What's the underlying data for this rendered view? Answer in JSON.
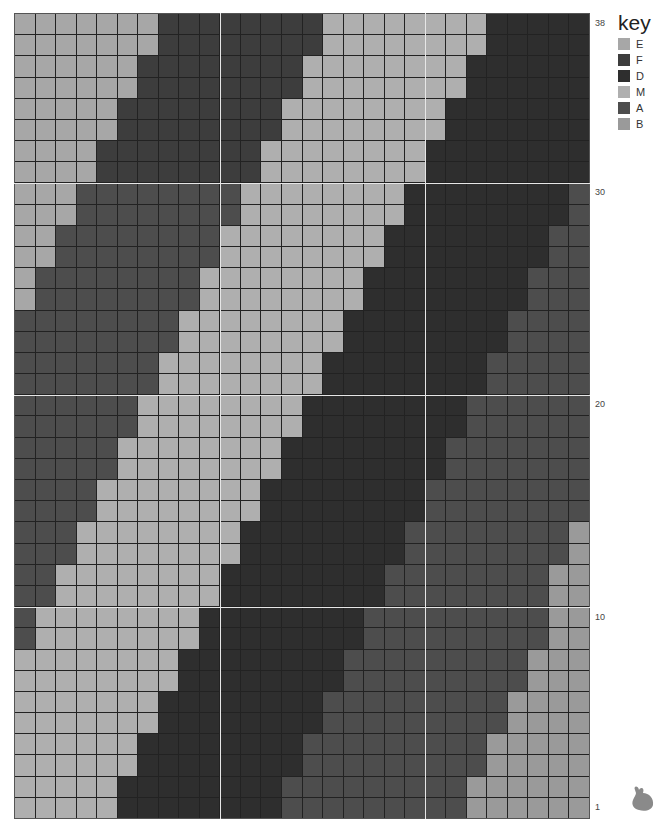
{
  "chart_data": {
    "type": "heatmap",
    "title": "",
    "columns": 28,
    "rows": 38,
    "row_labels": [
      {
        "label": "38",
        "row": 38
      },
      {
        "label": "30",
        "row": 30
      },
      {
        "label": "20",
        "row": 20
      },
      {
        "label": "10",
        "row": 10
      },
      {
        "label": "1",
        "row": 1
      }
    ],
    "legend_title": "key",
    "legend": [
      {
        "code": "E",
        "color": "#a7a7a7"
      },
      {
        "code": "F",
        "color": "#3d3d3d"
      },
      {
        "code": "D",
        "color": "#2e2e2e"
      },
      {
        "code": "M",
        "color": "#afafaf"
      },
      {
        "code": "A",
        "color": "#4d4d4d"
      },
      {
        "code": "B",
        "color": "#9a9a9a"
      }
    ],
    "grid_rows_top_to_bottom": [
      {
        "row": 38,
        "runs": [
          [
            "E",
            7
          ],
          [
            "F",
            8
          ],
          [
            "M",
            8
          ],
          [
            "D",
            5
          ]
        ]
      },
      {
        "row": 37,
        "runs": [
          [
            "E",
            7
          ],
          [
            "F",
            8
          ],
          [
            "M",
            8
          ],
          [
            "D",
            5
          ]
        ]
      },
      {
        "row": 36,
        "runs": [
          [
            "E",
            6
          ],
          [
            "F",
            8
          ],
          [
            "M",
            8
          ],
          [
            "D",
            6
          ]
        ]
      },
      {
        "row": 35,
        "runs": [
          [
            "E",
            6
          ],
          [
            "F",
            8
          ],
          [
            "M",
            8
          ],
          [
            "D",
            6
          ]
        ]
      },
      {
        "row": 34,
        "runs": [
          [
            "E",
            5
          ],
          [
            "F",
            8
          ],
          [
            "M",
            8
          ],
          [
            "D",
            7
          ]
        ]
      },
      {
        "row": 33,
        "runs": [
          [
            "E",
            5
          ],
          [
            "F",
            8
          ],
          [
            "M",
            8
          ],
          [
            "D",
            7
          ]
        ]
      },
      {
        "row": 32,
        "runs": [
          [
            "E",
            4
          ],
          [
            "F",
            8
          ],
          [
            "M",
            8
          ],
          [
            "D",
            8
          ]
        ]
      },
      {
        "row": 31,
        "runs": [
          [
            "E",
            4
          ],
          [
            "F",
            8
          ],
          [
            "M",
            8
          ],
          [
            "D",
            8
          ]
        ]
      },
      {
        "row": 30,
        "runs": [
          [
            "E",
            3
          ],
          [
            "A",
            8
          ],
          [
            "M",
            8
          ],
          [
            "D",
            8
          ],
          [
            "A",
            1
          ]
        ]
      },
      {
        "row": 29,
        "runs": [
          [
            "E",
            3
          ],
          [
            "A",
            8
          ],
          [
            "M",
            8
          ],
          [
            "D",
            8
          ],
          [
            "A",
            1
          ]
        ]
      },
      {
        "row": 28,
        "runs": [
          [
            "E",
            2
          ],
          [
            "A",
            8
          ],
          [
            "M",
            8
          ],
          [
            "D",
            8
          ],
          [
            "A",
            2
          ]
        ]
      },
      {
        "row": 27,
        "runs": [
          [
            "E",
            2
          ],
          [
            "A",
            8
          ],
          [
            "M",
            8
          ],
          [
            "D",
            8
          ],
          [
            "A",
            2
          ]
        ]
      },
      {
        "row": 26,
        "runs": [
          [
            "E",
            1
          ],
          [
            "A",
            8
          ],
          [
            "M",
            8
          ],
          [
            "D",
            8
          ],
          [
            "A",
            3
          ]
        ]
      },
      {
        "row": 25,
        "runs": [
          [
            "E",
            1
          ],
          [
            "A",
            8
          ],
          [
            "M",
            8
          ],
          [
            "D",
            8
          ],
          [
            "A",
            3
          ]
        ]
      },
      {
        "row": 24,
        "runs": [
          [
            "A",
            8
          ],
          [
            "M",
            8
          ],
          [
            "D",
            8
          ],
          [
            "A",
            4
          ]
        ]
      },
      {
        "row": 23,
        "runs": [
          [
            "A",
            8
          ],
          [
            "M",
            8
          ],
          [
            "D",
            8
          ],
          [
            "A",
            4
          ]
        ]
      },
      {
        "row": 22,
        "runs": [
          [
            "A",
            7
          ],
          [
            "M",
            8
          ],
          [
            "D",
            8
          ],
          [
            "A",
            5
          ]
        ]
      },
      {
        "row": 21,
        "runs": [
          [
            "A",
            7
          ],
          [
            "M",
            8
          ],
          [
            "D",
            8
          ],
          [
            "A",
            5
          ]
        ]
      },
      {
        "row": 20,
        "runs": [
          [
            "A",
            6
          ],
          [
            "M",
            8
          ],
          [
            "D",
            8
          ],
          [
            "A",
            6
          ]
        ]
      },
      {
        "row": 19,
        "runs": [
          [
            "A",
            6
          ],
          [
            "M",
            8
          ],
          [
            "D",
            8
          ],
          [
            "A",
            6
          ]
        ]
      },
      {
        "row": 18,
        "runs": [
          [
            "A",
            5
          ],
          [
            "M",
            8
          ],
          [
            "D",
            8
          ],
          [
            "A",
            7
          ]
        ]
      },
      {
        "row": 17,
        "runs": [
          [
            "A",
            5
          ],
          [
            "M",
            8
          ],
          [
            "D",
            8
          ],
          [
            "A",
            7
          ]
        ]
      },
      {
        "row": 16,
        "runs": [
          [
            "A",
            4
          ],
          [
            "M",
            8
          ],
          [
            "D",
            8
          ],
          [
            "A",
            8
          ]
        ]
      },
      {
        "row": 15,
        "runs": [
          [
            "A",
            4
          ],
          [
            "M",
            8
          ],
          [
            "D",
            8
          ],
          [
            "A",
            8
          ]
        ]
      },
      {
        "row": 14,
        "runs": [
          [
            "A",
            3
          ],
          [
            "M",
            8
          ],
          [
            "D",
            8
          ],
          [
            "A",
            8
          ],
          [
            "B",
            1
          ]
        ]
      },
      {
        "row": 13,
        "runs": [
          [
            "A",
            3
          ],
          [
            "M",
            8
          ],
          [
            "D",
            8
          ],
          [
            "A",
            8
          ],
          [
            "B",
            1
          ]
        ]
      },
      {
        "row": 12,
        "runs": [
          [
            "A",
            2
          ],
          [
            "M",
            8
          ],
          [
            "D",
            8
          ],
          [
            "A",
            8
          ],
          [
            "B",
            2
          ]
        ]
      },
      {
        "row": 11,
        "runs": [
          [
            "A",
            2
          ],
          [
            "M",
            8
          ],
          [
            "D",
            8
          ],
          [
            "A",
            8
          ],
          [
            "B",
            2
          ]
        ]
      },
      {
        "row": 10,
        "runs": [
          [
            "A",
            1
          ],
          [
            "M",
            8
          ],
          [
            "D",
            8
          ],
          [
            "A",
            9
          ],
          [
            "B",
            2
          ]
        ]
      },
      {
        "row": 9,
        "runs": [
          [
            "A",
            1
          ],
          [
            "M",
            8
          ],
          [
            "D",
            8
          ],
          [
            "A",
            9
          ],
          [
            "B",
            2
          ]
        ]
      },
      {
        "row": 8,
        "runs": [
          [
            "M",
            8
          ],
          [
            "D",
            8
          ],
          [
            "A",
            9
          ],
          [
            "B",
            3
          ]
        ]
      },
      {
        "row": 7,
        "runs": [
          [
            "M",
            8
          ],
          [
            "D",
            8
          ],
          [
            "A",
            9
          ],
          [
            "B",
            3
          ]
        ]
      },
      {
        "row": 6,
        "runs": [
          [
            "M",
            7
          ],
          [
            "D",
            8
          ],
          [
            "A",
            9
          ],
          [
            "B",
            4
          ]
        ]
      },
      {
        "row": 5,
        "runs": [
          [
            "M",
            7
          ],
          [
            "D",
            8
          ],
          [
            "A",
            9
          ],
          [
            "B",
            4
          ]
        ]
      },
      {
        "row": 4,
        "runs": [
          [
            "M",
            6
          ],
          [
            "D",
            8
          ],
          [
            "A",
            9
          ],
          [
            "B",
            5
          ]
        ]
      },
      {
        "row": 3,
        "runs": [
          [
            "M",
            6
          ],
          [
            "D",
            8
          ],
          [
            "A",
            9
          ],
          [
            "B",
            5
          ]
        ]
      },
      {
        "row": 2,
        "runs": [
          [
            "M",
            5
          ],
          [
            "D",
            8
          ],
          [
            "A",
            9
          ],
          [
            "B",
            6
          ]
        ]
      },
      {
        "row": 1,
        "runs": [
          [
            "M",
            5
          ],
          [
            "D",
            8
          ],
          [
            "A",
            9
          ],
          [
            "B",
            6
          ]
        ]
      }
    ],
    "major_gridlines_every": 10,
    "grid": true
  },
  "decorations": {
    "bunny_icon": "bunny-icon"
  }
}
